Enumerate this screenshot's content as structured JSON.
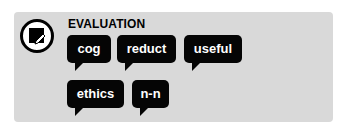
{
  "header": {
    "title": "EVALUATION",
    "icon": "edit-note-icon"
  },
  "tags": [
    {
      "label": "cog"
    },
    {
      "label": "reduct"
    },
    {
      "label": "useful"
    },
    {
      "label": "ethics"
    },
    {
      "label": "n-n"
    }
  ],
  "colors": {
    "panel": "#d9d9d9",
    "tag_bg": "#050505",
    "tag_text": "#ffffff"
  }
}
